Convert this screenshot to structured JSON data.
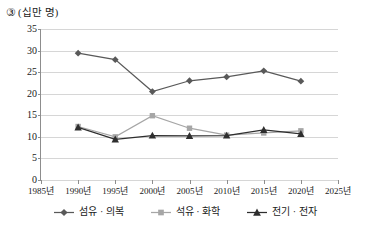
{
  "caption": {
    "marker": "③",
    "unit": "(십만 명)"
  },
  "chart_data": {
    "type": "line",
    "xlabel": "",
    "ylabel": "십만 명",
    "x": [
      "1985년",
      "1990년",
      "1995년",
      "2000년",
      "2005년",
      "2010년",
      "2015년",
      "2020년",
      "2025년"
    ],
    "categories": [
      "1985년",
      "1990년",
      "1995년",
      "2000년",
      "2005년",
      "2010년",
      "2015년",
      "2020년",
      "2025년"
    ],
    "xlim": [
      1985,
      2025
    ],
    "ylim": [
      0,
      35
    ],
    "yticks": [
      0,
      5,
      10,
      15,
      20,
      25,
      30,
      35
    ],
    "ytick_labels": [
      "0",
      "5",
      "10",
      "15",
      "20",
      "25",
      "30",
      "35"
    ],
    "grid": "horizontal",
    "legend_position": "bottom",
    "series": [
      {
        "name": "섬유 · 의복",
        "marker": "diamond",
        "color": "#595959",
        "points": [
          {
            "x": "1990년",
            "y": 29.4
          },
          {
            "x": "1995년",
            "y": 27.9
          },
          {
            "x": "2000년",
            "y": 20.5
          },
          {
            "x": "2005년",
            "y": 23.0
          },
          {
            "x": "2010년",
            "y": 23.9
          },
          {
            "x": "2015년",
            "y": 25.3
          },
          {
            "x": "2020년",
            "y": 22.9
          }
        ],
        "values": [
          null,
          29.4,
          27.9,
          20.5,
          23.0,
          23.9,
          25.3,
          22.9,
          null
        ]
      },
      {
        "name": "석유 · 화학",
        "marker": "square",
        "color": "#a6a6a6",
        "points": [
          {
            "x": "1990년",
            "y": 12.4
          },
          {
            "x": "1995년",
            "y": 10.0
          },
          {
            "x": "2000년",
            "y": 14.9
          },
          {
            "x": "2005년",
            "y": 12.0
          },
          {
            "x": "2010년",
            "y": 10.4
          },
          {
            "x": "2015년",
            "y": 10.9
          },
          {
            "x": "2020년",
            "y": 11.4
          }
        ],
        "values": [
          null,
          12.4,
          10.0,
          14.9,
          12.0,
          10.4,
          10.9,
          11.4,
          null
        ]
      },
      {
        "name": "전기 · 전자",
        "marker": "triangle",
        "color": "#2e2e2e",
        "points": [
          {
            "x": "1990년",
            "y": 12.2
          },
          {
            "x": "1995년",
            "y": 9.4
          },
          {
            "x": "2000년",
            "y": 10.3
          },
          {
            "x": "2005년",
            "y": 10.2
          },
          {
            "x": "2010년",
            "y": 10.3
          },
          {
            "x": "2015년",
            "y": 11.6
          },
          {
            "x": "2020년",
            "y": 10.7
          }
        ],
        "values": [
          null,
          12.2,
          9.4,
          10.3,
          10.2,
          10.3,
          11.6,
          10.7,
          null
        ]
      }
    ]
  },
  "legend": [
    {
      "label": "섬유 · 의복",
      "marker": "diamond",
      "color": "#595959"
    },
    {
      "label": "석유 · 화학",
      "marker": "square",
      "color": "#a6a6a6"
    },
    {
      "label": "전기 · 전자",
      "marker": "triangle",
      "color": "#2e2e2e"
    }
  ]
}
